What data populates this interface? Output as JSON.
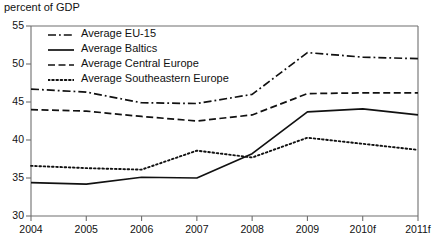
{
  "header": {
    "axis_note": "percent of GDP"
  },
  "legend": {
    "position": "top-left-inside",
    "items": [
      {
        "label": "Average EU-15",
        "style": "dash-dot",
        "color": "#111111"
      },
      {
        "label": "Average Baltics",
        "style": "solid",
        "color": "#111111"
      },
      {
        "label": "Average Central Europe",
        "style": "dashed",
        "color": "#111111"
      },
      {
        "label": "Average Southeastern Europe",
        "style": "dotted",
        "color": "#111111"
      }
    ]
  },
  "chart_data": {
    "type": "line",
    "title": "",
    "subtitle": "",
    "xlabel": "",
    "ylabel": "percent of GDP",
    "grid": false,
    "legend_position": "top-left-inside",
    "x": [
      "2004",
      "2005",
      "2006",
      "2007",
      "2008",
      "2009",
      "2010f",
      "2011f"
    ],
    "xlim": [
      "2004",
      "2011f"
    ],
    "ylim": [
      30,
      55
    ],
    "ytick_labels": [
      "30",
      "35",
      "40",
      "45",
      "50",
      "55"
    ],
    "yticks": [
      30,
      35,
      40,
      45,
      50,
      55
    ],
    "xtick_labels": [
      "2004",
      "2005",
      "2006",
      "2007",
      "2008",
      "2009",
      "2010f",
      "2011f"
    ],
    "series": [
      {
        "name": "Average EU-15",
        "style": "dash-dot",
        "color": "#111111",
        "values": [
          46.7,
          46.3,
          44.9,
          44.8,
          46.0,
          51.5,
          50.9,
          50.7
        ]
      },
      {
        "name": "Average Baltics",
        "style": "solid",
        "color": "#111111",
        "values": [
          34.4,
          34.2,
          35.1,
          35.0,
          38.2,
          43.7,
          44.1,
          43.3
        ]
      },
      {
        "name": "Average Central Europe",
        "style": "dashed",
        "color": "#111111",
        "values": [
          44.0,
          43.8,
          43.1,
          42.5,
          43.3,
          46.1,
          46.2,
          46.2
        ]
      },
      {
        "name": "Average Southeastern Europe",
        "style": "dotted",
        "color": "#111111",
        "values": [
          36.6,
          36.3,
          36.1,
          38.6,
          37.7,
          40.3,
          39.5,
          38.7
        ]
      }
    ]
  }
}
